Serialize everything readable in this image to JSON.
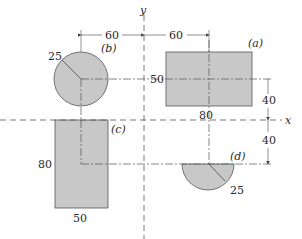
{
  "figure": {
    "axes": {
      "x_label": "x",
      "y_label": "y"
    },
    "shapes": [
      {
        "id": "a",
        "label": "(a)",
        "type": "rectangle",
        "width_label": "80",
        "height_label": "50"
      },
      {
        "id": "b",
        "label": "(b)",
        "type": "circle",
        "radius_label": "25"
      },
      {
        "id": "c",
        "label": "(c)",
        "type": "rectangle",
        "width_label": "50",
        "height_label": "80"
      },
      {
        "id": "d",
        "label": "(d)",
        "type": "semicircle",
        "radius_label": "25"
      }
    ],
    "dimensions": {
      "left_offset": "60",
      "right_offset": "60",
      "upper_offset": "40",
      "lower_offset": "40"
    },
    "colors": {
      "fill": "#c8c8c8",
      "stroke": "#555555",
      "line": "#444444"
    }
  }
}
